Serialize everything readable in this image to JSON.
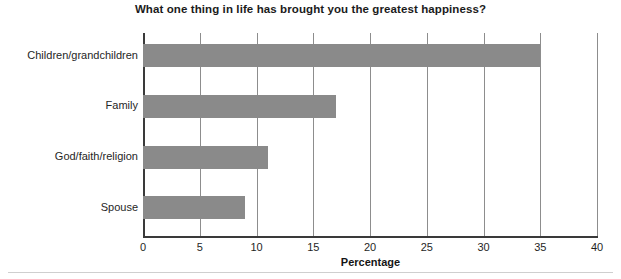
{
  "chart_data": {
    "type": "bar",
    "orientation": "horizontal",
    "title": "What one thing in life has brought you the greatest happiness?",
    "xlabel": "Percentage",
    "ylabel": "",
    "categories": [
      "Children/grandchildren",
      "Family",
      "God/faith/religion",
      "Spouse"
    ],
    "values": [
      35,
      17,
      11,
      9
    ],
    "xlim": [
      0,
      40
    ],
    "xticks": [
      0,
      5,
      10,
      15,
      20,
      25,
      30,
      35,
      40
    ],
    "xtick_labels": [
      "0",
      "5",
      "10",
      "15",
      "20",
      "25",
      "30",
      "35",
      "40"
    ],
    "grid": "vertical",
    "legend": "none",
    "bar_color": "#8a8a8a",
    "axis_color": "#3a3a3a",
    "gridline_color": "#8d8d8d",
    "background": "#ffffff"
  }
}
